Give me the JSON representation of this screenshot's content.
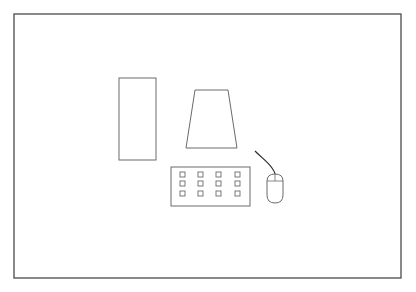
{
  "diagram": {
    "title": "",
    "colors": {
      "background": "#ffffff",
      "frame": "#4a4a4a",
      "line": "#6a6a6a",
      "cord": "#2a2a2a"
    },
    "frame": {
      "x": 14,
      "y": 14,
      "width": 387,
      "height": 264
    },
    "components": [
      {
        "id": "tower",
        "label": "computer-tower",
        "shape": "rect",
        "x": 119,
        "y": 78,
        "width": 37,
        "height": 82
      },
      {
        "id": "monitor",
        "label": "monitor",
        "shape": "trapezoid",
        "points": "195,90 228,90 237,148 186,148"
      },
      {
        "id": "keyboard",
        "label": "keyboard",
        "shape": "rect",
        "x": 171,
        "y": 167,
        "width": 79,
        "height": 39,
        "keys": {
          "cols": [
            180,
            198,
            216,
            235
          ],
          "rows": [
            172,
            181,
            191
          ],
          "size": 5
        }
      },
      {
        "id": "mouse",
        "label": "mouse",
        "shape": "mouse",
        "x": 267,
        "y": 173,
        "width": 16,
        "height": 30,
        "cord": "M255,151 C262,158 268,162 272,168 C274,171 275,173 275,174"
      }
    ]
  }
}
